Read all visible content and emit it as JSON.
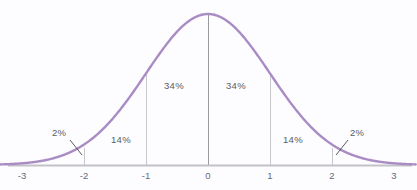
{
  "chart_data": {
    "type": "line",
    "title": "",
    "subtitle": "",
    "xlabel": "",
    "ylabel": "",
    "xlim": [
      -3.35,
      3.35
    ],
    "ylim": [
      0,
      1.05
    ],
    "grid": false,
    "legend": null,
    "curve": {
      "name": "Normal distribution (standard bell curve)",
      "function": "y = exp(-x^2 / 2)",
      "color": "#a98cc4",
      "line_width": 2.4,
      "peak_x": 0,
      "peak_y": 1
    },
    "x_ticks": [
      {
        "value": -3,
        "label": "-3",
        "px": 22
      },
      {
        "value": -2,
        "label": "-2",
        "px": 84
      },
      {
        "value": -1,
        "label": "-1",
        "px": 146
      },
      {
        "value": 0,
        "label": "0",
        "px": 208
      },
      {
        "value": 1,
        "label": "1",
        "px": 270
      },
      {
        "value": 2,
        "label": "2",
        "px": 332
      },
      {
        "value": 3,
        "label": "3",
        "px": 394
      }
    ],
    "y_ticks": [],
    "dividers": [
      {
        "at_x": -1,
        "px": 146,
        "top_px": 73,
        "bottom_px": 165,
        "color": "#c9c6cd"
      },
      {
        "at_x": 0,
        "px": 208,
        "top_px": 14,
        "bottom_px": 165,
        "color": "#9b9aa0"
      },
      {
        "at_x": 1,
        "px": 270,
        "top_px": 73,
        "bottom_px": 165,
        "color": "#c9c6cd"
      },
      {
        "at_x": -2,
        "px": 84,
        "top_px": 148,
        "bottom_px": 165,
        "color": "#c9c6cd"
      },
      {
        "at_x": 2,
        "px": 332,
        "top_px": 148,
        "bottom_px": 165,
        "color": "#c9c6cd"
      }
    ],
    "regions": [
      {
        "label": "2%",
        "from_x": -3,
        "to_x": -2,
        "percent": 2,
        "callout": true
      },
      {
        "label": "14%",
        "from_x": -2,
        "to_x": -1,
        "percent": 14,
        "callout": false
      },
      {
        "label": "34%",
        "from_x": -1,
        "to_x": 0,
        "percent": 34,
        "callout": false
      },
      {
        "label": "34%",
        "from_x": 0,
        "to_x": 1,
        "percent": 34,
        "callout": false
      },
      {
        "label": "14%",
        "from_x": 1,
        "to_x": 2,
        "percent": 14,
        "callout": false
      },
      {
        "label": "2%",
        "from_x": 2,
        "to_x": 3,
        "percent": 2,
        "callout": true
      }
    ],
    "annotations": [
      {
        "id": "pct-2-left",
        "text": "2%",
        "x_px": 52,
        "y_px": 128,
        "leader_from": [
          70,
          140
        ],
        "leader_to": [
          82,
          155
        ]
      },
      {
        "id": "pct-14-left",
        "text": "14%",
        "x_px": 111,
        "y_px": 135,
        "leader_from": null,
        "leader_to": null
      },
      {
        "id": "pct-34-left",
        "text": "34%",
        "x_px": 164,
        "y_px": 81,
        "leader_from": null,
        "leader_to": null
      },
      {
        "id": "pct-34-right",
        "text": "34%",
        "x_px": 226,
        "y_px": 81,
        "leader_from": null,
        "leader_to": null
      },
      {
        "id": "pct-14-right",
        "text": "14%",
        "x_px": 283,
        "y_px": 135,
        "leader_from": null,
        "leader_to": null
      },
      {
        "id": "pct-2-right",
        "text": "2%",
        "x_px": 350,
        "y_px": 128,
        "leader_from": [
          348,
          140
        ],
        "leader_to": [
          336,
          155
        ]
      }
    ],
    "axis": {
      "baseline_y_px": 165,
      "color": "#c3c2c7",
      "line_width": 2,
      "left_px": 8,
      "right_px": 412
    },
    "colors": {
      "background": "#fdfcfe",
      "curve": "#a98cc4",
      "axis": "#c3c2c7",
      "divider": "#c9c6cd",
      "divider_center": "#9b9aa0",
      "text": "#5c5c62",
      "tick_text": "#6a6a70",
      "leader": "#4a4a50"
    }
  }
}
